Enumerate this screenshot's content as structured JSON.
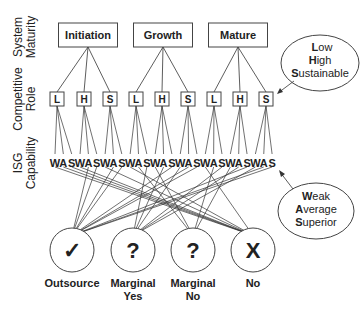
{
  "row_labels": {
    "maturity": [
      "System",
      "Maturity"
    ],
    "role": [
      "Competitive",
      "Role"
    ],
    "capability": [
      "ISG",
      "Capability"
    ]
  },
  "maturity_stages": [
    "Initiation",
    "Growth",
    "Mature"
  ],
  "roles": [
    "L",
    "H",
    "S"
  ],
  "capabilities": [
    "W",
    "A",
    "S"
  ],
  "outcomes": [
    {
      "symbol": "✓",
      "label": [
        "Outsource",
        ""
      ]
    },
    {
      "symbol": "?",
      "label": [
        "Marginal",
        "Yes"
      ]
    },
    {
      "symbol": "?",
      "label": [
        "Marginal",
        "No"
      ]
    },
    {
      "symbol": "X",
      "label": [
        "No",
        ""
      ]
    }
  ],
  "role_legend": [
    {
      "initial": "L",
      "rest": "ow"
    },
    {
      "initial": "H",
      "rest": "igh"
    },
    {
      "initial": "S",
      "rest": "ustainable"
    }
  ],
  "capability_legend": [
    {
      "initial": "W",
      "rest": "eak"
    },
    {
      "initial": "A",
      "rest": "verage"
    },
    {
      "initial": "S",
      "rest": "uperior"
    }
  ]
}
